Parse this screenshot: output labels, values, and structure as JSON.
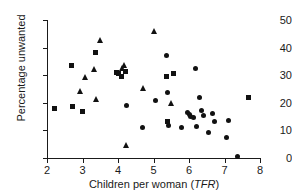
{
  "chart_data": {
    "type": "scatter",
    "title": "",
    "xlabel": "Children per woman (TFR)",
    "xlabel_plain": "Children per woman (",
    "xlabel_italic": "TFR",
    "xlabel_tail": ")",
    "ylabel": "Percentage unwanted",
    "xlim": [
      2,
      8
    ],
    "ylim": [
      0,
      50
    ],
    "xticks": [
      2,
      3,
      4,
      5,
      6,
      7,
      8
    ],
    "yticks": [
      0,
      10,
      20,
      30,
      40,
      50
    ],
    "grid": false,
    "legend": "none",
    "marker_color": "#111111",
    "series": [
      {
        "name": "circle",
        "marker": "circle",
        "points": [
          [
            4.25,
            19.0
          ],
          [
            4.7,
            11.1
          ],
          [
            5.05,
            20.7
          ],
          [
            5.38,
            37.2
          ],
          [
            5.4,
            23.9
          ],
          [
            5.4,
            13.3
          ],
          [
            5.42,
            11.6
          ],
          [
            5.8,
            11.0
          ],
          [
            5.95,
            16.6
          ],
          [
            6.0,
            15.6
          ],
          [
            6.05,
            15.0
          ],
          [
            6.12,
            14.8
          ],
          [
            6.18,
            32.6
          ],
          [
            6.2,
            11.5
          ],
          [
            6.3,
            22.0
          ],
          [
            6.35,
            17.2
          ],
          [
            6.42,
            15.4
          ],
          [
            6.55,
            9.3
          ],
          [
            6.65,
            16.2
          ],
          [
            6.72,
            13.2
          ],
          [
            7.05,
            7.3
          ],
          [
            7.12,
            13.7
          ],
          [
            7.38,
            0.4
          ]
        ]
      },
      {
        "name": "square",
        "marker": "square",
        "points": [
          [
            2.2,
            18.1
          ],
          [
            2.68,
            33.4
          ],
          [
            2.72,
            18.7
          ],
          [
            3.0,
            16.8
          ],
          [
            3.38,
            38.4
          ],
          [
            3.95,
            31.0
          ],
          [
            4.02,
            30.6
          ],
          [
            4.1,
            29.6
          ],
          [
            4.2,
            31.3
          ],
          [
            5.38,
            29.4
          ],
          [
            5.4,
            13.4
          ],
          [
            5.55,
            30.7
          ],
          [
            7.68,
            22.0
          ]
        ]
      },
      {
        "name": "triangle",
        "marker": "triangle",
        "points": [
          [
            2.92,
            24.3
          ],
          [
            3.08,
            29.3
          ],
          [
            3.32,
            32.2
          ],
          [
            3.38,
            21.3
          ],
          [
            3.5,
            42.9
          ],
          [
            4.1,
            32.5
          ],
          [
            4.18,
            33.8
          ],
          [
            4.22,
            4.8
          ],
          [
            4.7,
            25.5
          ],
          [
            5.0,
            46.1
          ],
          [
            5.48,
            20.1
          ]
        ]
      }
    ]
  }
}
